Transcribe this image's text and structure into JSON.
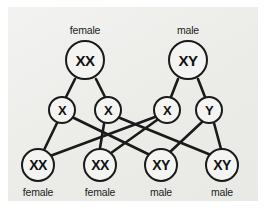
{
  "figure": {
    "background_color": "#efefed",
    "stroke_color": "#1a1a1a",
    "node_fill": "#f4f4f2"
  },
  "parents": [
    {
      "id": "mother",
      "genotype": "XX",
      "label": "female",
      "cx": 85,
      "cy": 60,
      "label_x": 85,
      "label_y": 24
    },
    {
      "id": "father",
      "genotype": "XY",
      "label": "male",
      "cx": 188,
      "cy": 60,
      "label_x": 188,
      "label_y": 24
    }
  ],
  "gametes": [
    {
      "id": "egg-x1",
      "allele": "X",
      "cx": 62,
      "cy": 110,
      "from": "mother"
    },
    {
      "id": "egg-x2",
      "allele": "X",
      "cx": 108,
      "cy": 110,
      "from": "mother"
    },
    {
      "id": "sperm-x",
      "allele": "X",
      "cx": 167,
      "cy": 110,
      "from": "father"
    },
    {
      "id": "sperm-y",
      "allele": "Y",
      "cx": 209,
      "cy": 110,
      "from": "father"
    }
  ],
  "offspring": [
    {
      "id": "child-1",
      "genotype": "XX",
      "label": "female",
      "cx": 38,
      "cy": 165,
      "label_x": 38,
      "label_y": 186
    },
    {
      "id": "child-2",
      "genotype": "XX",
      "label": "female",
      "cx": 100,
      "cy": 165,
      "label_x": 100,
      "label_y": 186
    },
    {
      "id": "child-3",
      "genotype": "XY",
      "label": "male",
      "cx": 161,
      "cy": 165,
      "label_x": 161,
      "label_y": 186
    },
    {
      "id": "child-4",
      "genotype": "XY",
      "label": "male",
      "cx": 222,
      "cy": 165,
      "label_x": 222,
      "label_y": 186
    }
  ],
  "edges": [
    {
      "name": "mother-to-egg-x1",
      "x1": 75,
      "y1": 79,
      "x2": 66,
      "y2": 97
    },
    {
      "name": "mother-to-egg-x2",
      "x1": 96,
      "y1": 79,
      "x2": 105,
      "y2": 97
    },
    {
      "name": "father-to-sperm-x",
      "x1": 178,
      "y1": 79,
      "x2": 171,
      "y2": 97
    },
    {
      "name": "father-to-sperm-y",
      "x1": 198,
      "y1": 79,
      "x2": 205,
      "y2": 97
    },
    {
      "name": "egg-x1-to-child-1",
      "x1": 57,
      "y1": 123,
      "x2": 44,
      "y2": 150
    },
    {
      "name": "egg-x1-to-child-3",
      "x1": 74,
      "y1": 118,
      "x2": 150,
      "y2": 155
    },
    {
      "name": "egg-x2-to-child-2",
      "x1": 104,
      "y1": 124,
      "x2": 100,
      "y2": 148
    },
    {
      "name": "egg-x2-to-child-4",
      "x1": 120,
      "y1": 118,
      "x2": 211,
      "y2": 155
    },
    {
      "name": "sperm-x-to-child-1",
      "x1": 155,
      "y1": 117,
      "x2": 50,
      "y2": 156
    },
    {
      "name": "sperm-x-to-child-2",
      "x1": 157,
      "y1": 120,
      "x2": 111,
      "y2": 153
    },
    {
      "name": "sperm-y-to-child-3",
      "x1": 202,
      "y1": 122,
      "x2": 170,
      "y2": 152
    },
    {
      "name": "sperm-y-to-child-4",
      "x1": 214,
      "y1": 123,
      "x2": 221,
      "y2": 149
    }
  ]
}
